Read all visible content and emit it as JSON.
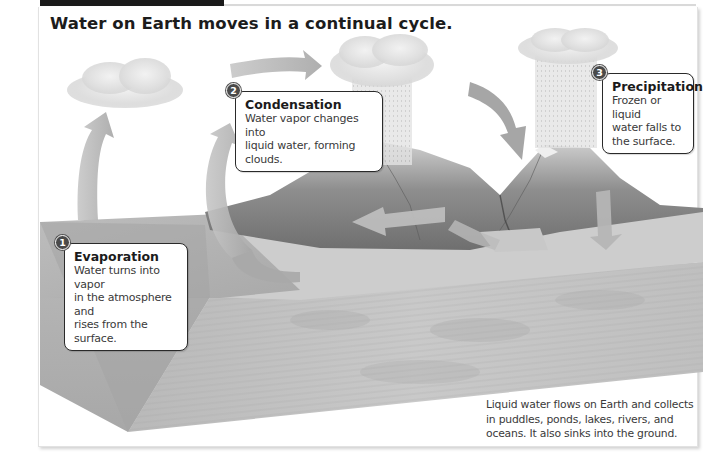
{
  "diagram": {
    "title": "Water on Earth moves in a continual cycle.",
    "steps": [
      {
        "number": "1",
        "title": "Evaporation",
        "body_lines": [
          "Water turns into vapor",
          "in the atmosphere and",
          "rises from the surface."
        ]
      },
      {
        "number": "2",
        "title": "Condensation",
        "body_lines": [
          "Water vapor changes into",
          "liquid water, forming clouds."
        ]
      },
      {
        "number": "3",
        "title": "Precipitation",
        "body_lines": [
          "Frozen or liquid",
          "water falls to",
          "the surface."
        ]
      }
    ],
    "caption_lines": [
      "Liquid water flows on Earth and collects",
      "in puddles, ponds, lakes, rivers, and",
      "oceans. It also sinks into the ground."
    ],
    "illustration": {
      "elements": [
        "cloud-left",
        "cloud-center-rain",
        "cloud-right-rain",
        "mountains",
        "ocean-block",
        "ground-cross-section"
      ],
      "arrows": [
        "evaporation-up-left",
        "evaporation-up-center",
        "wind-right",
        "precipitation-down",
        "runoff-left",
        "infiltration-down"
      ]
    },
    "colors": {
      "arrow": "#b8b8b8",
      "badge": "#4a4a4a",
      "callout_border": "#2a2a2a",
      "water": "#a8a8a8",
      "ground": "#c4c4c4"
    }
  }
}
